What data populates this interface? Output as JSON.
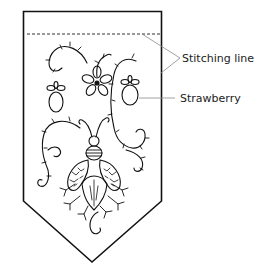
{
  "diagram": {
    "type": "embroidery-banner-pattern",
    "labels": {
      "stitching_line": "Stitching line",
      "strawberry": "Strawberry"
    },
    "colors": {
      "outline": "#111111",
      "leader": "#8a8a8a",
      "background": "#ffffff"
    },
    "elements": [
      "banner-outline",
      "stitching-line",
      "strawberry-left",
      "strawberry-right",
      "flower",
      "bee",
      "vines"
    ]
  }
}
